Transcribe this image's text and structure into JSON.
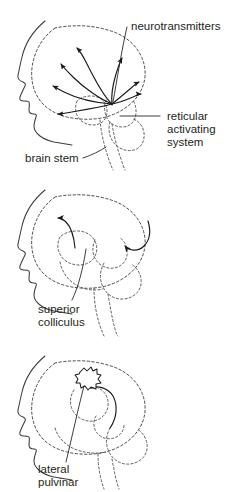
{
  "figure": {
    "background_color": "#ffffff",
    "ink_color": "#231f20",
    "panel_count": 3
  },
  "panels": [
    {
      "id": "panel-reticular-activating-system",
      "index": 1,
      "description": "Head profile with arrows radiating from the brainstem across the cortex",
      "labels": [
        {
          "id": "neurotransmitters",
          "text": "neurotransmitters",
          "lines": [
            "neurotransmitters"
          ]
        },
        {
          "id": "reticular-activating-system",
          "text": "reticular activating system",
          "lines": [
            "reticular",
            "activating",
            "system"
          ]
        },
        {
          "id": "brain-stem",
          "text": "brain stem",
          "lines": [
            "brain stem"
          ]
        }
      ],
      "arrow_count": 7
    },
    {
      "id": "panel-superior-colliculus",
      "index": 2,
      "description": "Head profile with two curved arrows from the midbrain",
      "labels": [
        {
          "id": "superior-colliculus",
          "text": "superior colliculus",
          "lines": [
            "superior",
            "colliculus"
          ]
        }
      ],
      "arrow_count": 2
    },
    {
      "id": "panel-lateral-pulvinar",
      "index": 3,
      "description": "Head profile with starburst activation at the pulvinar and a curved arrow",
      "labels": [
        {
          "id": "lateral-pulvinar",
          "text": "lateral pulvinar",
          "lines": [
            "lateral",
            "pulvinar"
          ]
        }
      ],
      "arrow_count": 1
    }
  ],
  "text": {
    "neurotransmitters": "neurotransmitters",
    "reticular_line1": "reticular",
    "reticular_line2": "activating",
    "reticular_line3": "system",
    "brain_stem": "brain stem",
    "superior_line1": "superior",
    "superior_line2": "colliculus",
    "pulvinar_line1": "lateral",
    "pulvinar_line2": "pulvinar"
  }
}
